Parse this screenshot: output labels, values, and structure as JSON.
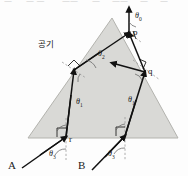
{
  "figure": {
    "medium_label": "공기",
    "points": {
      "p": "p",
      "q": "q",
      "r": "r"
    },
    "rays": {
      "a": "A",
      "b": "B"
    },
    "angles": {
      "theta0_top": "θ",
      "theta0_top_sub": "0",
      "theta2_center": "θ",
      "theta2_center_sub": "2",
      "theta1_left": "θ",
      "theta1_left_sub": "1",
      "theta1_right": "θ",
      "theta1_right_sub": "1",
      "theta3_left": "θ",
      "theta3_left_sub": "3",
      "theta3_right": "θ",
      "theta3_right_sub": "3"
    },
    "colors": {
      "prism_fill": "#d9d9d6",
      "prism_stroke": "#b3b3ae",
      "ray_stroke": "#111111",
      "normal_stroke": "#999999",
      "text": "#1a1a1a"
    },
    "geometry": {
      "apex": [
        112,
        18
      ],
      "base_left": [
        28,
        138
      ],
      "base_right": [
        178,
        138
      ],
      "p": [
        129,
        33
      ],
      "q": [
        145,
        72
      ],
      "r": [
        66,
        137
      ],
      "s": [
        125,
        136
      ],
      "left_face_hit": [
        74,
        70
      ]
    },
    "top_strip_fragments": [
      "—",
      "— —",
      "——",
      "—",
      "——",
      "—",
      "—"
    ]
  }
}
